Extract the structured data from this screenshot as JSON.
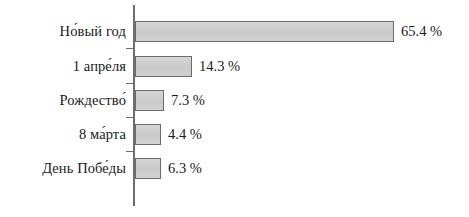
{
  "chart_data": {
    "type": "bar",
    "orientation": "horizontal",
    "title": "",
    "subtitle": "",
    "xlabel": "",
    "ylabel": "",
    "xlim": [
      0,
      65.4
    ],
    "grid": false,
    "legend": null,
    "value_suffix": " %",
    "categories": [
      "Но́вый год",
      "1 апре́ля",
      "Рождество́",
      "8 ма́рта",
      "День Побе́ды"
    ],
    "values": [
      65.4,
      14.3,
      7.3,
      4.4,
      6.3
    ],
    "value_labels": [
      "65.4 %",
      "14.3 %",
      "7.3 %",
      "4.4 %",
      "6.3 %"
    ],
    "bars": [
      {
        "label": "Но́вый год",
        "value": 65.4,
        "value_label": "65.4 %"
      },
      {
        "label": "1 апре́ля",
        "value": 14.3,
        "value_label": "14.3 %"
      },
      {
        "label": "Рождество́",
        "value": 7.3,
        "value_label": "7.3 %"
      },
      {
        "label": "8 ма́рта",
        "value": 4.4,
        "value_label": "4.4 %"
      },
      {
        "label": "День Побе́ды",
        "value": 6.3,
        "value_label": "6.3 %"
      }
    ],
    "colors": {
      "bar_fill": "#cdcdcd",
      "bar_border": "#6b6b6b",
      "axis": "#6e6e6e",
      "text": "#1a1a1a",
      "background": "#ffffff"
    }
  }
}
